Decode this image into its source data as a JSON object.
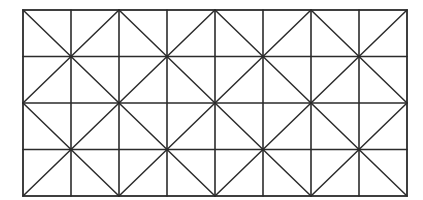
{
  "diagram": {
    "title": "",
    "type": "grid-with-diagonals",
    "canvas": {
      "width": 423,
      "height": 200,
      "background": "#ffffff"
    },
    "grid": {
      "left": 23,
      "top": 10,
      "right": 407,
      "bottom": 196,
      "columns": 8,
      "rows": 4,
      "line_color": "#2b2b2b"
    },
    "diagonal_blocks": {
      "block_size_cells": 2,
      "blocks_across": 4,
      "blocks_down": 2,
      "pattern": "X through center of each 2x2 block"
    },
    "labels": []
  }
}
